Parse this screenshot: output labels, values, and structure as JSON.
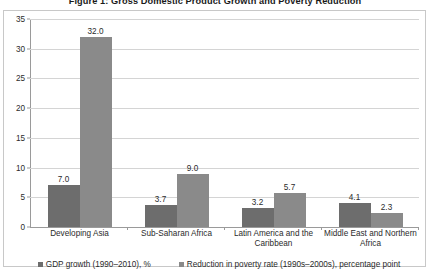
{
  "chart_data": {
    "type": "bar",
    "title": "Figure 1: Gross Domestic Product Growth and Poverty Reduction",
    "xlabel": "",
    "ylabel": "",
    "ylim": [
      0,
      35
    ],
    "ytick_step": 5,
    "yticks": [
      "35",
      "30",
      "25",
      "20",
      "15",
      "10",
      "5",
      "0"
    ],
    "ytick_values": [
      35,
      30,
      25,
      20,
      15,
      10,
      5,
      0
    ],
    "grid": "horizontal",
    "legend_position": "bottom",
    "categories": [
      "Developing Asia",
      "Sub-Saharan Africa",
      "Latin America and the Caribbean",
      "Middle East and Northern Africa"
    ],
    "series": [
      {
        "name": "GDP growth (1990–2010), %",
        "color": "#6d6d6d",
        "values": [
          7.0,
          3.7,
          3.2,
          4.1
        ],
        "labels": [
          "7.0",
          "3.7",
          "3.2",
          "4.1"
        ]
      },
      {
        "name": "Reduction in poverty rate (1990s–2000s), percentage point",
        "color": "#8a8a8a",
        "values": [
          32.0,
          9.0,
          5.7,
          2.3
        ],
        "labels": [
          "32.0",
          "9.0",
          "5.7",
          "2.3"
        ]
      }
    ]
  },
  "legend": {
    "items": [
      {
        "label": "GDP growth (1990–2010), %"
      },
      {
        "label": "Reduction in poverty rate (1990s–2000s), percentage point"
      }
    ]
  }
}
